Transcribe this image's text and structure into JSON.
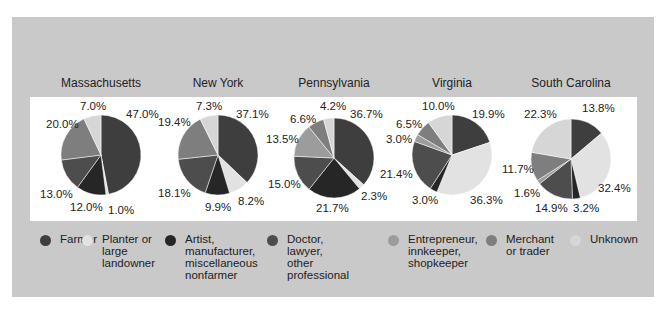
{
  "chart_data": {
    "type": "pie",
    "title": "",
    "categories": [
      "Farmer",
      "Planter or large landowner",
      "Artist, manufacturer, miscellaneous nonfarmer",
      "Doctor, lawyer, other professional",
      "Entrepreneur, innkeeper, shopkeeper",
      "Merchant or trader",
      "Unknown"
    ],
    "colors": [
      "#3e3e3e",
      "#e2e2e2",
      "#262626",
      "#4d4d4d",
      "#9c9c9c",
      "#7e7e7e",
      "#d6d6d6"
    ],
    "series": [
      {
        "name": "Massachusetts",
        "values": [
          47.0,
          1.0,
          12.0,
          13.0,
          null,
          20.0,
          7.0
        ]
      },
      {
        "name": "New York",
        "values": [
          37.1,
          8.2,
          9.9,
          18.1,
          null,
          19.4,
          7.3
        ]
      },
      {
        "name": "Pennsylvania",
        "values": [
          36.7,
          2.3,
          21.7,
          15.0,
          13.5,
          6.6,
          4.2
        ]
      },
      {
        "name": "Virginia",
        "values": [
          19.9,
          36.3,
          3.0,
          21.4,
          3.0,
          6.5,
          10.0
        ]
      },
      {
        "name": "South Carolina",
        "values": [
          13.8,
          32.4,
          3.2,
          14.9,
          1.6,
          11.7,
          22.3
        ]
      }
    ],
    "legend_position": "bottom",
    "grid": false
  },
  "states": [
    {
      "name": "Massachusetts",
      "cx": 101,
      "cy": 155,
      "title_x": 101
    },
    {
      "name": "New York",
      "cx": 218,
      "cy": 155,
      "title_x": 218
    },
    {
      "name": "Pennsylvania",
      "cx": 334,
      "cy": 158,
      "title_x": 334
    },
    {
      "name": "Virginia",
      "cx": 452,
      "cy": 155,
      "title_x": 452
    },
    {
      "name": "South Carolina",
      "cx": 571,
      "cy": 159,
      "title_x": 571
    }
  ],
  "labels": [
    [
      {
        "t": "47.0%",
        "x": 126,
        "y": 118
      },
      {
        "t": "1.0%",
        "x": 108,
        "y": 214
      },
      {
        "t": "12.0%",
        "x": 70,
        "y": 211
      },
      {
        "t": "13.0%",
        "x": 40,
        "y": 198
      },
      {
        "t": "20.0%",
        "x": 46,
        "y": 128
      },
      {
        "t": "7.0%",
        "x": 80,
        "y": 110
      }
    ],
    [
      {
        "t": "37.1%",
        "x": 236,
        "y": 118
      },
      {
        "t": "8.2%",
        "x": 238,
        "y": 205
      },
      {
        "t": "9.9%",
        "x": 205,
        "y": 211
      },
      {
        "t": "18.1%",
        "x": 158,
        "y": 197
      },
      {
        "t": "19.4%",
        "x": 158,
        "y": 126
      },
      {
        "t": "7.3%",
        "x": 196,
        "y": 110
      }
    ],
    [
      {
        "t": "36.7%",
        "x": 350,
        "y": 118
      },
      {
        "t": "2.3%",
        "x": 361,
        "y": 200
      },
      {
        "t": "21.7%",
        "x": 316,
        "y": 212
      },
      {
        "t": "15.0%",
        "x": 268,
        "y": 188
      },
      {
        "t": "13.5%",
        "x": 266,
        "y": 143
      },
      {
        "t": "6.6%",
        "x": 290,
        "y": 123
      },
      {
        "t": "4.2%",
        "x": 320,
        "y": 110
      }
    ],
    [
      {
        "t": "19.9%",
        "x": 472,
        "y": 118
      },
      {
        "t": "36.3%",
        "x": 470,
        "y": 204
      },
      {
        "t": "3.0%",
        "x": 412,
        "y": 204
      },
      {
        "t": "21.4%",
        "x": 380,
        "y": 178
      },
      {
        "t": "3.0%",
        "x": 386,
        "y": 143
      },
      {
        "t": "6.5%",
        "x": 396,
        "y": 128
      },
      {
        "t": "10.0%",
        "x": 422,
        "y": 110
      }
    ],
    [
      {
        "t": "13.8%",
        "x": 582,
        "y": 112
      },
      {
        "t": "32.4%",
        "x": 598,
        "y": 192
      },
      {
        "t": "3.2%",
        "x": 573,
        "y": 212
      },
      {
        "t": "14.9%",
        "x": 535,
        "y": 212
      },
      {
        "t": "1.6%",
        "x": 514,
        "y": 197
      },
      {
        "t": "11.7%",
        "x": 502,
        "y": 173
      },
      {
        "t": "22.3%",
        "x": 524,
        "y": 118
      }
    ]
  ],
  "legend": [
    {
      "label": "Farmer",
      "x": 40
    },
    {
      "label": "Planter or\nlarge\nlandowner",
      "x": 82
    },
    {
      "label": "Artist,\nmanufacturer,\nmiscellaneous\nnonfarmer",
      "x": 165
    },
    {
      "label": "Doctor,\nlawyer,\nother\nprofessional",
      "x": 267
    },
    {
      "label": "Entrepreneur,\ninnkeeper,\nshopkeeper",
      "x": 388
    },
    {
      "label": "Merchant\nor trader",
      "x": 486
    },
    {
      "label": "Unknown",
      "x": 570
    }
  ]
}
